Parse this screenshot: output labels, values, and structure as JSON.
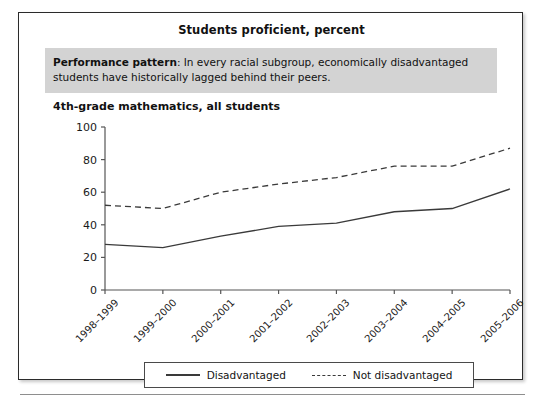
{
  "figure": {
    "title": "Students proficient, percent",
    "callout": {
      "lead": "Performance pattern",
      "separator": ": ",
      "text": "In every racial subgroup, economically disadvantaged students have historically lagged behind their peers."
    },
    "subtitle": "4th-grade mathematics, all students"
  },
  "colors": {
    "callout_background": "#d3d3d3",
    "line": "#3a3a3a",
    "axis": "#555555",
    "frame": "#2b2b2b"
  },
  "legend": {
    "items": [
      {
        "label": "Disadvantaged",
        "style": "solid"
      },
      {
        "label": "Not disadvantaged",
        "style": "dashed"
      }
    ]
  },
  "chart_data": {
    "type": "line",
    "title": "4th-grade mathematics, all students",
    "xlabel": "",
    "ylabel": "Students proficient, percent",
    "ylim": [
      0,
      100
    ],
    "yticks": [
      0,
      20,
      40,
      60,
      80,
      100
    ],
    "grid": false,
    "legend_position": "bottom",
    "categories": [
      "1998–1999",
      "1999–2000",
      "2000–2001",
      "2001–2002",
      "2002–2003",
      "2003–2004",
      "2004–2005",
      "2005–2006"
    ],
    "series": [
      {
        "name": "Disadvantaged",
        "style": "solid",
        "values": [
          28,
          26,
          33,
          39,
          41,
          48,
          50,
          62
        ]
      },
      {
        "name": "Not disadvantaged",
        "style": "dashed",
        "values": [
          52,
          50,
          60,
          65,
          69,
          76,
          76,
          87
        ]
      }
    ]
  }
}
